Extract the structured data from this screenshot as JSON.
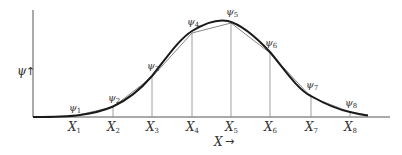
{
  "figure": {
    "y_axis_label": "ψ",
    "y_axis_arrow": "↑",
    "x_axis_label": "X",
    "x_axis_arrow": "→",
    "colors": {
      "axis": "#555555",
      "curve": "#1a1a1a",
      "polyline": "#777777",
      "ordinate": "#888888",
      "text": "#333333"
    },
    "nodes": [
      {
        "x_label": "X",
        "x_sub": "1",
        "psi_label": "ψ",
        "psi_sub": "1"
      },
      {
        "x_label": "X",
        "x_sub": "2",
        "psi_label": "ψ",
        "psi_sub": "2"
      },
      {
        "x_label": "X",
        "x_sub": "3",
        "psi_label": "ψ",
        "psi_sub": "3"
      },
      {
        "x_label": "X",
        "x_sub": "4",
        "psi_label": "ψ",
        "psi_sub": "4"
      },
      {
        "x_label": "X",
        "x_sub": "5",
        "psi_label": "ψ",
        "psi_sub": "5"
      },
      {
        "x_label": "X",
        "x_sub": "6",
        "psi_label": "ψ",
        "psi_sub": "6"
      },
      {
        "x_label": "X",
        "x_sub": "7",
        "psi_label": "ψ",
        "psi_sub": "7"
      },
      {
        "x_label": "X",
        "x_sub": "8",
        "psi_label": "ψ",
        "psi_sub": "8"
      }
    ]
  }
}
